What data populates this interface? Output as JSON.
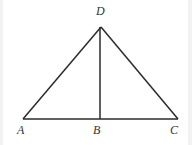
{
  "figure": {
    "kind": "geometry-diagram",
    "width": 192,
    "height": 145,
    "background_color": "#ffffff",
    "line_color": "#2b2b2b",
    "label_color": "#333333",
    "edge_band_color": "#f0f0f0",
    "points": {
      "A": {
        "label": "A",
        "x": 23,
        "y": 119,
        "label_x": 17,
        "label_y": 124
      },
      "B": {
        "label": "B",
        "x": 100,
        "y": 119,
        "label_x": 93,
        "label_y": 124
      },
      "C": {
        "label": "C",
        "x": 178,
        "y": 119,
        "label_x": 170,
        "label_y": 124
      },
      "D": {
        "label": "D",
        "x": 101,
        "y": 27,
        "label_x": 96,
        "label_y": 5
      }
    },
    "segments": [
      {
        "name": "side-AD",
        "from": "A",
        "to": "D",
        "x1": 23,
        "y1": 119,
        "x2": 101,
        "y2": 27
      },
      {
        "name": "side-DC",
        "from": "D",
        "to": "C",
        "x1": 101,
        "y1": 27,
        "x2": 178,
        "y2": 119
      },
      {
        "name": "base-AC",
        "from": "A",
        "to": "C",
        "x1": 23,
        "y1": 119,
        "x2": 178,
        "y2": 119
      },
      {
        "name": "altitude-DB",
        "from": "D",
        "to": "B",
        "x1": 100,
        "y1": 27,
        "x2": 100,
        "y2": 119
      }
    ]
  }
}
